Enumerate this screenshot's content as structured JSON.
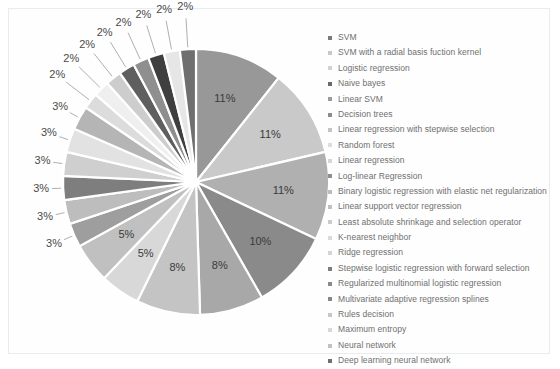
{
  "chart_data": {
    "type": "pie",
    "title": "",
    "legend_position": "right",
    "value_suffix": "%",
    "categories": [
      "SVM",
      "SVM with a radial basis fuction kernel",
      "Logistic regression",
      "Naive bayes",
      "Linear SVM",
      "Decision trees",
      "Linear regression with stepwise selection",
      "Random forest",
      "Linear regression",
      "Log-linear Regression",
      "Binary logistic regression with elastic net regularization",
      "Linear support vector regression",
      "Least absolute shrinkage and selection operator",
      "K-nearest neighbor",
      "Ridge regression",
      "Stepwise logistic regression with forward selection",
      "Regularized multinomial logistic regression",
      "Multivariate adaptive regression splines",
      "Rules decision",
      "Maximum entropy",
      "Neural network",
      "Deep learning neural network"
    ],
    "values": [
      11,
      11,
      11,
      10,
      8,
      8,
      5,
      5,
      3,
      3,
      3,
      3,
      3,
      3,
      2,
      2,
      2,
      2,
      2,
      2,
      2,
      2
    ],
    "labels": [
      "11%",
      "11%",
      "11%",
      "10%",
      "8%",
      "8%",
      "5%",
      "5%",
      "3%",
      "3%",
      "3%",
      "3%",
      "3%",
      "3%",
      "2%",
      "2%",
      "2%",
      "2%",
      "2%",
      "2%",
      "2%",
      "2%"
    ],
    "colors": [
      "#989898",
      "#c9c9c9",
      "#b0b0b0",
      "#8a8a8a",
      "#a8a8a8",
      "#c4c4c4",
      "#d8d8d8",
      "#c0c0c0",
      "#9e9e9e",
      "#bdbdbd",
      "#7e7e7e",
      "#cfcfcf",
      "#e2e2e2",
      "#b5b5b5",
      "#dcdcdc",
      "#efefef",
      "#cdcdcd",
      "#5f5f5f",
      "#8f8f8f",
      "#3f3f3f",
      "#e6e6e6",
      "#6f6f6f"
    ],
    "colors_legend": [
      "#7a7a7a",
      "#c9c9c9",
      "#d2d2d2",
      "#6a6a6a",
      "#9b9b9b",
      "#8c8c8c",
      "#c4c4c4",
      "#dcdcdc",
      "#d6d6d6",
      "#8f8f8f",
      "#bdbdbd",
      "#c0c0c0",
      "#cbcbcb",
      "#dadada",
      "#d4d4d4",
      "#7d7d7d",
      "#8a8a8a",
      "#868686",
      "#c7c7c7",
      "#d8d8d8",
      "#c2c2c2",
      "#707070"
    ]
  },
  "geometry": {
    "center_x": 196,
    "center_y": 182,
    "radius": 133,
    "start_angle": -90
  }
}
